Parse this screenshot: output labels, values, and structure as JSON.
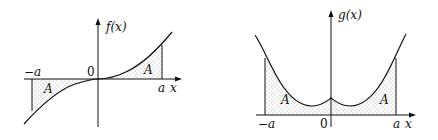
{
  "figure": {
    "left_graph": {
      "y_axis_label": "f(x)",
      "x_axis_label": "x",
      "origin_label": "0",
      "neg_bound_label": "−a",
      "pos_bound_label": "a",
      "left_area_label": "A",
      "right_area_label": "A",
      "description": "Odd function f(x) through origin; shaded region between curve and x-axis on [−a,0] (below axis) and [0,a] (above axis), each of area A"
    },
    "right_graph": {
      "y_axis_label": "g(x)",
      "x_axis_label": "x",
      "origin_label": "0",
      "neg_bound_label": "−a",
      "pos_bound_label": "a",
      "left_area_label": "A",
      "right_area_label": "A",
      "description": "Even function g(x) with cusp at x=0; shaded region under curve on [−a,0] and [0,a], each of area A"
    },
    "colors": {
      "line": "#111111",
      "fill_dots": "#555555",
      "background": "#ffffff"
    }
  }
}
